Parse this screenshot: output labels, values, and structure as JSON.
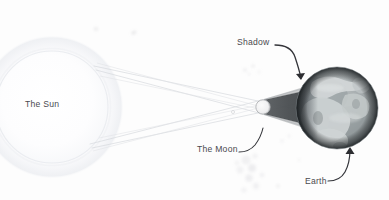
{
  "diagram": {
    "background_color": "#fdfdfd",
    "label_color": "#4a4a4f",
    "labels": [
      {
        "id": "sun",
        "text": "The Sun",
        "x": 25,
        "y": 99,
        "leader": false
      },
      {
        "id": "shadow",
        "text": "Shadow",
        "x": 237,
        "y": 37,
        "leader": true
      },
      {
        "id": "moon",
        "text": "The Moon",
        "x": 197,
        "y": 144,
        "leader": true
      },
      {
        "id": "earth",
        "text": "Earth",
        "x": 305,
        "y": 176,
        "leader": true
      }
    ],
    "bodies": [
      {
        "name": "sun",
        "label": "The Sun",
        "shape": "circle",
        "cx": 52,
        "cy": 107,
        "r": 56,
        "fill": "#fefeff",
        "glow_color": "#eef0f4",
        "description": "Large pale luminous disc at far left, source of light rays"
      },
      {
        "name": "moon",
        "label": "The Moon",
        "shape": "circle",
        "cx": 263,
        "cy": 107,
        "r": 7,
        "fill": "#f2f2f3",
        "edge_color": "#9a9a9e",
        "description": "Small light sphere between Sun and Earth casting the umbra"
      },
      {
        "name": "earth",
        "label": "Earth",
        "shape": "circle",
        "cx": 337,
        "cy": 108,
        "r": 41,
        "fill": "#9ea4a6",
        "land_color": "#c9cfd0",
        "ocean_color": "#8e969a",
        "terminator_color": "#3c4144",
        "description": "Grey textured globe at right with continents, dark limb on left and right"
      }
    ],
    "shadow_cone": {
      "name": "umbra",
      "label": "Shadow",
      "color": "#45494c",
      "apex_x": 263,
      "apex_y": 107,
      "base_x": 341,
      "base_half_height": 26,
      "description": "Dark cone of shadow cast by the Moon onto the Earth's surface"
    },
    "light_rays": {
      "color": "#d6d9dd",
      "stroke_width": 0.6,
      "count": 4,
      "description": "Tangent light rays from the top and bottom edges of the Sun crossing near the Moon"
    },
    "crossing_point": {
      "x": 233,
      "y": 112
    },
    "leader_line_color": "#3a3a3e",
    "dust_specks": {
      "color": "#d8d8da",
      "description": "Faint grey speckles scattered in the background near the Moon"
    }
  }
}
